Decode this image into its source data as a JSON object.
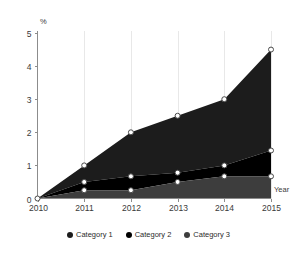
{
  "chart_data": {
    "type": "area",
    "stacked": true,
    "title": "",
    "subtitle": "",
    "xlabel": "Year",
    "ylabel": "%",
    "x": [
      "2010",
      "2011",
      "2012",
      "2013",
      "2014",
      "2015"
    ],
    "categories": [
      "2010",
      "2011",
      "2012",
      "2013",
      "2014",
      "2015"
    ],
    "xtick_labels": [
      "2010",
      "2011",
      "2012",
      "2013",
      "2014",
      "2015"
    ],
    "ytick_labels": [
      "0",
      "1",
      "2",
      "3",
      "4",
      "5"
    ],
    "ytick_values": [
      0,
      1,
      2,
      3,
      4,
      5
    ],
    "ylim": [
      0,
      5
    ],
    "grid": true,
    "grid_axis": "x",
    "legend_position": "bottom",
    "series": [
      {
        "name": "Category 1",
        "color": "#1c1c1c",
        "values": [
          0,
          0.5,
          1.33,
          1.72,
          2.0,
          3.05
        ],
        "cumulative_values": [
          0,
          1.0,
          2.0,
          2.5,
          3.0,
          4.5
        ]
      },
      {
        "name": "Category 2",
        "color": "#000000",
        "values": [
          0,
          0.25,
          0.42,
          0.28,
          0.33,
          0.78
        ],
        "cumulative_values": [
          0,
          0.5,
          0.67,
          0.78,
          1.0,
          1.45
        ]
      },
      {
        "name": "Category 3",
        "color": "#3d3d3d",
        "values": [
          0,
          0.25,
          0.25,
          0.5,
          0.67,
          0.67
        ],
        "cumulative_values": [
          0,
          0.25,
          0.25,
          0.5,
          0.67,
          0.67
        ]
      }
    ]
  },
  "axes": {
    "y_unit_label": "%",
    "x_axis_label": "Year"
  },
  "legend": {
    "items": [
      {
        "label": "Category 1",
        "color": "#1c1c1c",
        "marker": "circle-dot"
      },
      {
        "label": "Category 2",
        "color": "#000000",
        "marker": "circle-dot"
      },
      {
        "label": "Category 3",
        "color": "#3d3d3d",
        "marker": "circle-dot"
      }
    ]
  },
  "colors": {
    "series_1": "#1c1c1c",
    "series_2": "#000000",
    "series_3": "#3d3d3d",
    "axis": "#8c8c8c",
    "grid": "#e8e8e8",
    "marker_fill": "#ffffff",
    "marker_stroke": "#4a4a4a",
    "background": "#ffffff"
  }
}
